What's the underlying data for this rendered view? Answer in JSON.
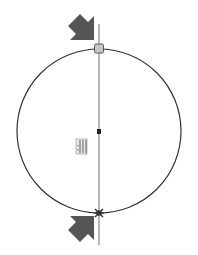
{
  "canvas": {
    "width": 198,
    "height": 255,
    "background": "#ffffff"
  },
  "sketch": {
    "circle": {
      "cx": 99,
      "cy": 131,
      "r": 82,
      "stroke": "#333333"
    },
    "centerline": {
      "x": 99,
      "y1": 24,
      "y2": 245,
      "stroke": "#777777"
    },
    "center_point": {
      "x": 99,
      "y": 131
    },
    "top_point": {
      "x": 99,
      "y": 49,
      "type": "square-handle"
    },
    "bottom_point": {
      "x": 99,
      "y": 213,
      "type": "coincident-star"
    },
    "constraint_icon": {
      "name": "vertical-constraint-icon",
      "x": 76,
      "y": 138
    }
  },
  "arrows": [
    {
      "name": "arrow-top",
      "direction": "down-right",
      "color": "#555555"
    },
    {
      "name": "arrow-bottom",
      "direction": "up-right",
      "color": "#555555"
    }
  ]
}
